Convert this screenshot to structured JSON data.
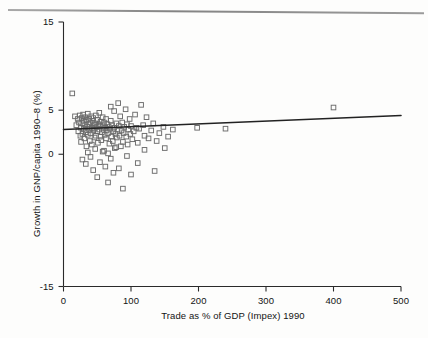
{
  "chart_data": {
    "type": "scatter",
    "title": "",
    "xlabel": "Trade as % of GDP (Impex) 1990",
    "ylabel": "Growth in GNP/capita 1990–8 (%)",
    "xlim": [
      0,
      500
    ],
    "ylim": [
      -15,
      15
    ],
    "xticks": [
      0,
      100,
      200,
      300,
      400,
      500
    ],
    "xtick_labels": [
      "0",
      "100",
      "200",
      "300",
      "400",
      "500"
    ],
    "yticks": [
      -15,
      0,
      5,
      15
    ],
    "ytick_labels": [
      "-15",
      "0",
      "5",
      "15"
    ],
    "grid": false,
    "legend": null,
    "marker": "open-square",
    "marker_color": "#6b6b6b",
    "trendline": {
      "type": "linear",
      "x": [
        0,
        500
      ],
      "y": [
        2.8,
        4.4
      ],
      "color": "#222222"
    },
    "series": [
      {
        "name": "Countries",
        "points": [
          [
            13,
            6.9
          ],
          [
            17,
            4.3
          ],
          [
            19,
            3.3
          ],
          [
            21,
            4.0
          ],
          [
            22,
            2.6
          ],
          [
            23,
            3.6
          ],
          [
            24,
            4.4
          ],
          [
            25,
            2.1
          ],
          [
            26,
            3.0
          ],
          [
            26,
            1.4
          ],
          [
            27,
            4.1
          ],
          [
            28,
            3.5
          ],
          [
            28,
            2.3
          ],
          [
            29,
            4.5
          ],
          [
            30,
            3.8
          ],
          [
            30,
            2.9
          ],
          [
            31,
            1.8
          ],
          [
            32,
            3.3
          ],
          [
            32,
            4.2
          ],
          [
            33,
            2.5
          ],
          [
            34,
            3.9
          ],
          [
            34,
            0.9
          ],
          [
            35,
            3.1
          ],
          [
            36,
            4.6
          ],
          [
            36,
            2.2
          ],
          [
            37,
            3.4
          ],
          [
            38,
            2.8
          ],
          [
            38,
            4.0
          ],
          [
            39,
            1.5
          ],
          [
            40,
            3.6
          ],
          [
            40,
            2.4
          ],
          [
            41,
            4.3
          ],
          [
            42,
            3.0
          ],
          [
            42,
            1.1
          ],
          [
            43,
            3.8
          ],
          [
            44,
            2.7
          ],
          [
            44,
            4.1
          ],
          [
            45,
            3.3
          ],
          [
            46,
            1.9
          ],
          [
            46,
            2.9
          ],
          [
            47,
            3.5
          ],
          [
            48,
            4.4
          ],
          [
            48,
            2.1
          ],
          [
            49,
            3.1
          ],
          [
            50,
            2.6
          ],
          [
            50,
            3.9
          ],
          [
            51,
            1.3
          ],
          [
            52,
            3.4
          ],
          [
            53,
            2.8
          ],
          [
            53,
            4.7
          ],
          [
            54,
            3.2
          ],
          [
            55,
            2.0
          ],
          [
            55,
            3.7
          ],
          [
            56,
            1.6
          ],
          [
            57,
            2.5
          ],
          [
            58,
            3.3
          ],
          [
            58,
            4.2
          ],
          [
            59,
            2.9
          ],
          [
            60,
            0.4
          ],
          [
            60,
            3.6
          ],
          [
            61,
            2.2
          ],
          [
            62,
            3.0
          ],
          [
            63,
            1.8
          ],
          [
            63,
            4.0
          ],
          [
            64,
            2.7
          ],
          [
            65,
            3.4
          ],
          [
            66,
            0.1
          ],
          [
            66,
            2.4
          ],
          [
            67,
            3.1
          ],
          [
            68,
            1.2
          ],
          [
            69,
            2.9
          ],
          [
            70,
            3.8
          ],
          [
            70,
            5.4
          ],
          [
            71,
            2.0
          ],
          [
            72,
            3.3
          ],
          [
            73,
            1.5
          ],
          [
            74,
            2.6
          ],
          [
            75,
            4.9
          ],
          [
            75,
            3.0
          ],
          [
            76,
            0.7
          ],
          [
            77,
            2.3
          ],
          [
            78,
            3.5
          ],
          [
            79,
            1.9
          ],
          [
            80,
            2.8
          ],
          [
            81,
            5.8
          ],
          [
            82,
            3.2
          ],
          [
            83,
            2.1
          ],
          [
            84,
            4.3
          ],
          [
            85,
            0.9
          ],
          [
            86,
            2.7
          ],
          [
            87,
            3.6
          ],
          [
            88,
            1.4
          ],
          [
            89,
            2.4
          ],
          [
            90,
            3.1
          ],
          [
            92,
            5.1
          ],
          [
            93,
            2.0
          ],
          [
            94,
            3.4
          ],
          [
            95,
            1.1
          ],
          [
            96,
            2.8
          ],
          [
            98,
            4.0
          ],
          [
            99,
            2.3
          ],
          [
            100,
            3.2
          ],
          [
            102,
            1.7
          ],
          [
            104,
            2.6
          ],
          [
            106,
            4.5
          ],
          [
            108,
            3.0
          ],
          [
            110,
            1.3
          ],
          [
            112,
            2.9
          ],
          [
            115,
            5.6
          ],
          [
            118,
            3.3
          ],
          [
            120,
            2.1
          ],
          [
            123,
            4.2
          ],
          [
            126,
            1.8
          ],
          [
            130,
            2.7
          ],
          [
            133,
            3.5
          ],
          [
            138,
            1.5
          ],
          [
            142,
            2.4
          ],
          [
            148,
            3.1
          ],
          [
            155,
            2.0
          ],
          [
            162,
            2.8
          ],
          [
            198,
            3.0
          ],
          [
            240,
            2.9
          ],
          [
            400,
            5.3
          ],
          [
            28,
            -0.6
          ],
          [
            33,
            -1.1
          ],
          [
            36,
            0.2
          ],
          [
            40,
            -0.3
          ],
          [
            44,
            -1.8
          ],
          [
            47,
            0.6
          ],
          [
            50,
            -2.6
          ],
          [
            54,
            -0.9
          ],
          [
            58,
            0.3
          ],
          [
            62,
            -1.4
          ],
          [
            66,
            -3.2
          ],
          [
            70,
            -0.5
          ],
          [
            74,
            -2.1
          ],
          [
            78,
            0.8
          ],
          [
            82,
            -1.6
          ],
          [
            88,
            -3.9
          ],
          [
            94,
            -0.2
          ],
          [
            100,
            -2.3
          ],
          [
            110,
            -1.0
          ],
          [
            120,
            0.5
          ],
          [
            135,
            -1.9
          ],
          [
            150,
            0.7
          ]
        ]
      }
    ]
  },
  "axes": {
    "y_title": "Growth in GNP/capita 1990–8 (%)",
    "x_title": "Trade as % of GDP (Impex) 1990"
  }
}
